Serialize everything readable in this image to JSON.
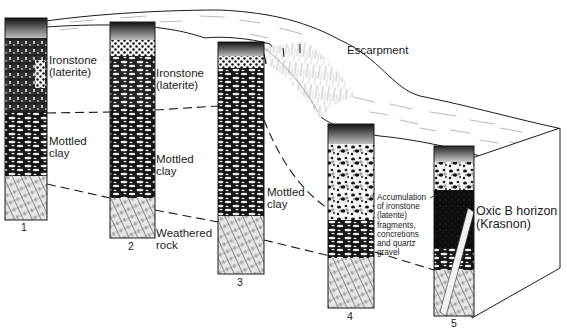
{
  "diagram": {
    "type": "block-diagram",
    "labels": {
      "escarpment": "Escarpment",
      "profile1_ironstone": "Ironstone\n(laterite)",
      "profile1_mottled": "Mottled\nclay",
      "profile2_ironstone": "Ironstone\n(laterite)",
      "profile2_mottled": "Mottled\nclay",
      "profile2_weathered": "Weathered\nrock",
      "profile3_mottled": "Mottled\nclay",
      "profile4_accumulation": "Accumulation\nof ironstone\n(laterite)\nfragments,\nconcretions\nand quartz\ngravel",
      "profile5_oxic": "Oxic B horizon\n(Krasnon)"
    },
    "profiles": [
      {
        "number": "1",
        "horizons": [
          "Ironstone (laterite)",
          "Mottled clay",
          "Weathered rock"
        ]
      },
      {
        "number": "2",
        "horizons": [
          "Ironstone (laterite)",
          "Mottled clay",
          "Weathered rock"
        ]
      },
      {
        "number": "3",
        "horizons": [
          "Ironstone (laterite)",
          "Mottled clay",
          "Weathered rock"
        ]
      },
      {
        "number": "4",
        "horizons": [
          "Accumulation of ironstone fragments",
          "Mottled clay",
          "Weathered rock"
        ]
      },
      {
        "number": "5",
        "horizons": [
          "Gravel layer",
          "Oxic B horizon (Krasnon)",
          "Weathered rock"
        ]
      }
    ],
    "colors": {
      "ink": "#1a1a1a",
      "background": "#ffffff",
      "shade_dark": "#222222",
      "shade_mid": "#7a7a7a",
      "shade_light": "#d8d8d8"
    }
  }
}
